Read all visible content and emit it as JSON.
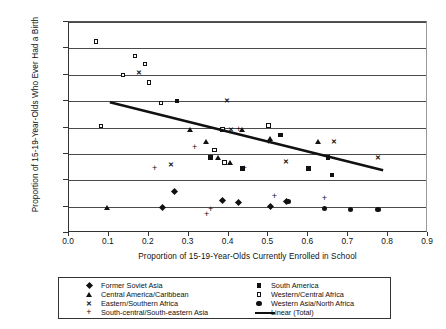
{
  "chart_data": {
    "type": "scatter",
    "title": "",
    "xlabel": "Proportion of 15-19-Year-Olds Currently Enrolled in School",
    "ylabel": "Proportion of 15-19-Year-Olds Who Ever Had a Birth",
    "xlim": [
      0.0,
      0.9
    ],
    "ylim": [
      0.0,
      0.4
    ],
    "xticks": [
      "0.0",
      "0.1",
      "0.2",
      "0.3",
      "0.4",
      "0.5",
      "0.6",
      "0.7",
      "0.8",
      "0.9"
    ],
    "xtick_values": [
      0.0,
      0.1,
      0.2,
      0.3,
      0.4,
      0.5,
      0.6,
      0.7,
      0.8,
      0.9
    ],
    "yticks": [
      "0.00",
      "0.05",
      "0.10",
      "0.15",
      "0.20",
      "0.25",
      "0.30",
      "0.35",
      "0.40"
    ],
    "ytick_values": [
      0.0,
      0.05,
      0.1,
      0.15,
      0.2,
      0.25,
      0.3,
      0.35,
      0.4
    ],
    "grid": "horizontal",
    "legend_position": "bottom",
    "series": [
      {
        "name": "Former Soviet Asia",
        "marker": "diamond",
        "color": "#111111",
        "points": [
          {
            "x": 0.235,
            "y": 0.049
          },
          {
            "x": 0.265,
            "y": 0.079
          },
          {
            "x": 0.385,
            "y": 0.061
          },
          {
            "x": 0.425,
            "y": 0.057
          },
          {
            "x": 0.505,
            "y": 0.05
          },
          {
            "x": 0.545,
            "y": 0.06
          }
        ]
      },
      {
        "name": "Central America/Caribbean",
        "marker": "triangle",
        "color": "#111111",
        "points": [
          {
            "x": 0.095,
            "y": 0.047
          },
          {
            "x": 0.305,
            "y": 0.196
          },
          {
            "x": 0.345,
            "y": 0.172
          },
          {
            "x": 0.375,
            "y": 0.143
          },
          {
            "x": 0.405,
            "y": 0.133
          },
          {
            "x": 0.435,
            "y": 0.196
          },
          {
            "x": 0.505,
            "y": 0.178
          },
          {
            "x": 0.625,
            "y": 0.172
          }
        ]
      },
      {
        "name": "Eastern/Southern Africa",
        "marker": "x",
        "color": "#111111",
        "points": [
          {
            "x": 0.175,
            "y": 0.303
          },
          {
            "x": 0.255,
            "y": 0.128
          },
          {
            "x": 0.395,
            "y": 0.25
          },
          {
            "x": 0.405,
            "y": 0.196
          },
          {
            "x": 0.505,
            "y": 0.172
          },
          {
            "x": 0.545,
            "y": 0.135
          },
          {
            "x": 0.665,
            "y": 0.172
          },
          {
            "x": 0.775,
            "y": 0.143
          }
        ]
      },
      {
        "name": "South-central/South-eastern Asia",
        "marker": "plus",
        "color": "#111111",
        "points": [
          {
            "x": 0.215,
            "y": 0.122
          },
          {
            "x": 0.315,
            "y": 0.162
          },
          {
            "x": 0.345,
            "y": 0.035
          },
          {
            "x": 0.355,
            "y": 0.045
          },
          {
            "x": 0.425,
            "y": 0.196
          },
          {
            "x": 0.44,
            "y": 0.122
          },
          {
            "x": 0.515,
            "y": 0.069
          },
          {
            "x": 0.64,
            "y": 0.066
          }
        ]
      },
      {
        "name": "South America",
        "marker": "square",
        "color": "#111111",
        "points": [
          {
            "x": 0.27,
            "y": 0.25
          },
          {
            "x": 0.355,
            "y": 0.143
          },
          {
            "x": 0.435,
            "y": 0.122
          },
          {
            "x": 0.53,
            "y": 0.186
          },
          {
            "x": 0.6,
            "y": 0.122
          },
          {
            "x": 0.65,
            "y": 0.143
          },
          {
            "x": 0.66,
            "y": 0.11
          }
        ]
      },
      {
        "name": "Western/Central Africa",
        "marker": "open-square",
        "color": "#111111",
        "points": [
          {
            "x": 0.067,
            "y": 0.363
          },
          {
            "x": 0.08,
            "y": 0.203
          },
          {
            "x": 0.135,
            "y": 0.299
          },
          {
            "x": 0.165,
            "y": 0.336
          },
          {
            "x": 0.19,
            "y": 0.32
          },
          {
            "x": 0.2,
            "y": 0.285
          },
          {
            "x": 0.23,
            "y": 0.247
          },
          {
            "x": 0.365,
            "y": 0.157
          },
          {
            "x": 0.385,
            "y": 0.196
          },
          {
            "x": 0.39,
            "y": 0.134
          },
          {
            "x": 0.5,
            "y": 0.204
          }
        ]
      },
      {
        "name": "Western Asia/North Africa",
        "marker": "dot",
        "color": "#111111",
        "points": [
          {
            "x": 0.55,
            "y": 0.06
          },
          {
            "x": 0.64,
            "y": 0.046
          },
          {
            "x": 0.705,
            "y": 0.044
          },
          {
            "x": 0.775,
            "y": 0.044
          }
        ]
      }
    ],
    "trendline": {
      "name": "Linear (Total)",
      "x_start": 0.105,
      "y_start": 0.246,
      "x_end": 0.79,
      "y_end": 0.117,
      "color": "#111111"
    }
  },
  "legend": {
    "left_items": [
      {
        "label": "Former Soviet Asia",
        "marker": "diamond"
      },
      {
        "label": "Central America/Caribbean",
        "marker": "triangle"
      },
      {
        "label": "Eastern/Southern Africa",
        "marker": "x"
      },
      {
        "label": "South-central/South-eastern Asia",
        "marker": "plus"
      }
    ],
    "right_items": [
      {
        "label": "South America",
        "marker": "square"
      },
      {
        "label": "Western/Central Africa",
        "marker": "open-square"
      },
      {
        "label": "Western Asia/North Africa",
        "marker": "dot"
      },
      {
        "label": "Linear (Total)",
        "marker": "line"
      }
    ]
  }
}
